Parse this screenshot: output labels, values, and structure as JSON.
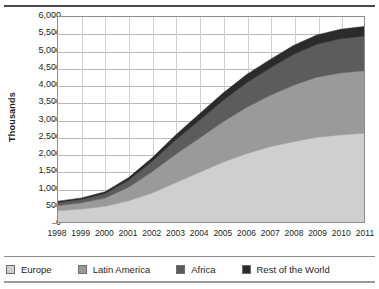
{
  "chart_data": {
    "type": "area",
    "stacked": true,
    "title": "",
    "xlabel": "",
    "ylabel": "Thousands",
    "grid": true,
    "legend_position": "bottom",
    "categories": [
      "1998",
      "1999",
      "2000",
      "2001",
      "2002",
      "2003",
      "2004",
      "2005",
      "2006",
      "2007",
      "2008",
      "2009",
      "2010",
      "2011"
    ],
    "ylim": [
      0,
      6000
    ],
    "yticks": [
      "0",
      "500",
      "1,000",
      "1,500",
      "2,000",
      "2,500",
      "3,000",
      "3,500",
      "4,000",
      "4,500",
      "5,000",
      "5,500",
      "6,000"
    ],
    "ytick_values": [
      0,
      500,
      1000,
      1500,
      2000,
      2500,
      3000,
      3500,
      4000,
      4500,
      5000,
      5500,
      6000
    ],
    "series": [
      {
        "name": "Europe",
        "color": "#cfcfcf",
        "values": [
          330,
          380,
          460,
          620,
          850,
          1150,
          1450,
          1750,
          2000,
          2200,
          2350,
          2480,
          2550,
          2600
        ]
      },
      {
        "name": "Latin America",
        "color": "#9a9a9a",
        "values": [
          150,
          180,
          240,
          400,
          620,
          830,
          1000,
          1180,
          1350,
          1500,
          1650,
          1760,
          1810,
          1830
        ]
      },
      {
        "name": "Africa",
        "color": "#5c5c5c",
        "values": [
          90,
          100,
          130,
          200,
          300,
          420,
          520,
          620,
          720,
          800,
          900,
          960,
          1000,
          1010
        ]
      },
      {
        "name": "Rest of the World",
        "color": "#2b2b2b",
        "values": [
          40,
          45,
          55,
          80,
          110,
          150,
          190,
          220,
          240,
          250,
          265,
          275,
          280,
          285
        ]
      }
    ]
  },
  "legend": {
    "items": [
      {
        "label": "Europe",
        "color": "#cfcfcf"
      },
      {
        "label": "Latin America",
        "color": "#9a9a9a"
      },
      {
        "label": "Africa",
        "color": "#5c5c5c"
      },
      {
        "label": "Rest of the World",
        "color": "#2b2b2b"
      }
    ]
  }
}
